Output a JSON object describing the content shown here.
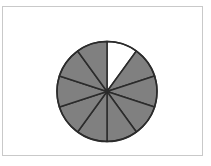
{
  "figure": {
    "background_color": "#ffffff",
    "frame": {
      "name": "image-border",
      "stroke_color": "#c9c9c9",
      "stroke_width": 1,
      "x": 2,
      "y": 6,
      "width": 201,
      "height": 150
    }
  },
  "chart_data": {
    "type": "pie",
    "title": "",
    "subtitle": "",
    "xlabel": "",
    "ylabel": "",
    "grid": false,
    "legend": "none",
    "labels_shown": false,
    "center_x": 107,
    "center_y": 91.5,
    "radius": 50,
    "total_slices": 10,
    "slice_angle_degrees": 36,
    "start_angle_degrees": 0,
    "direction": "clockwise",
    "shaded_count": 9,
    "unshaded_count": 1,
    "fraction_shaded": "9/10",
    "fraction_shaded_decimal": 0.9,
    "outline_color": "#2b2b2b",
    "outline_width": 1.5,
    "shaded_color": "#808080",
    "unshaded_color": "#ffffff",
    "categories": [
      "slice-1",
      "slice-2",
      "slice-3",
      "slice-4",
      "slice-5",
      "slice-6",
      "slice-7",
      "slice-8",
      "slice-9",
      "slice-10"
    ],
    "values": [
      36,
      36,
      36,
      36,
      36,
      36,
      36,
      36,
      36,
      36
    ],
    "slices": [
      {
        "index": 1,
        "start_deg": 0,
        "end_deg": 36,
        "filled": false,
        "color": "#ffffff"
      },
      {
        "index": 2,
        "start_deg": 36,
        "end_deg": 72,
        "filled": true,
        "color": "#808080"
      },
      {
        "index": 3,
        "start_deg": 72,
        "end_deg": 108,
        "filled": true,
        "color": "#808080"
      },
      {
        "index": 4,
        "start_deg": 108,
        "end_deg": 144,
        "filled": true,
        "color": "#808080"
      },
      {
        "index": 5,
        "start_deg": 144,
        "end_deg": 180,
        "filled": true,
        "color": "#808080"
      },
      {
        "index": 6,
        "start_deg": 180,
        "end_deg": 216,
        "filled": true,
        "color": "#808080"
      },
      {
        "index": 7,
        "start_deg": 216,
        "end_deg": 252,
        "filled": true,
        "color": "#808080"
      },
      {
        "index": 8,
        "start_deg": 252,
        "end_deg": 288,
        "filled": true,
        "color": "#808080"
      },
      {
        "index": 9,
        "start_deg": 288,
        "end_deg": 324,
        "filled": true,
        "color": "#808080"
      },
      {
        "index": 10,
        "start_deg": 324,
        "end_deg": 360,
        "filled": true,
        "color": "#808080"
      }
    ]
  }
}
